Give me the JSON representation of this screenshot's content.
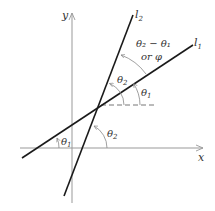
{
  "diagram": {
    "type": "angle-between-lines",
    "axes": {
      "x_label": "x",
      "y_label": "y"
    },
    "lines": [
      {
        "id": "l1",
        "label": "l",
        "subscript": "1"
      },
      {
        "id": "l2",
        "label": "l",
        "subscript": "2"
      }
    ],
    "angles": {
      "theta1": {
        "symbol": "θ",
        "subscript": "1"
      },
      "theta2": {
        "symbol": "θ",
        "subscript": "2"
      },
      "difference": {
        "line1": "θ₂ − θ₁",
        "line2": "or φ"
      }
    },
    "colors": {
      "line": "#1a1a1a",
      "axis": "#999999",
      "arc": "#888888",
      "text": "#333333"
    }
  }
}
